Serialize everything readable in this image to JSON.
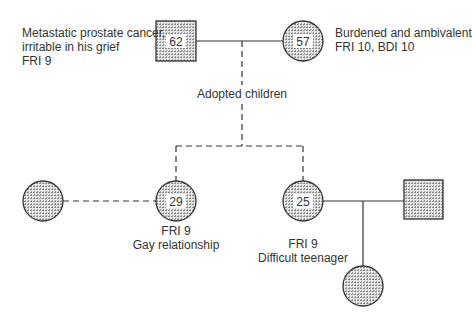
{
  "diagram": {
    "type": "genogram",
    "colors": {
      "stroke": "#333333",
      "fill_pattern": "#9a9a9a",
      "background": "#ffffff"
    },
    "father": {
      "shape": "square",
      "age": "62",
      "notes": [
        "Metastatic prostate cancer,",
        "irritable in his grief",
        "FRI 9"
      ]
    },
    "mother": {
      "shape": "circle",
      "age": "57",
      "notes": [
        "Burdened and ambivalent",
        "FRI 10, BDI 10"
      ]
    },
    "adoption_label": "Adopted children",
    "children": [
      {
        "shape": "circle",
        "age": "29",
        "notes": [
          "FRI 9",
          "Gay relationship"
        ],
        "partner": {
          "shape": "circle",
          "relationship": "dashed"
        }
      },
      {
        "shape": "circle",
        "age": "25",
        "notes": [
          "FRI 9",
          "Difficult teenager"
        ],
        "partner": {
          "shape": "square",
          "relationship": "solid"
        },
        "child": {
          "shape": "circle"
        }
      }
    ]
  }
}
